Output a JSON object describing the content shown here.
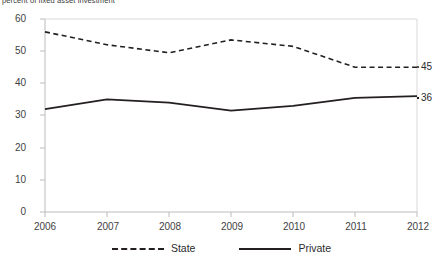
{
  "chart_data": {
    "type": "line",
    "title": "",
    "subtitle": "percent of fixed asset investment",
    "xlabel": "",
    "ylabel": "",
    "categories": [
      "2006",
      "2007",
      "2008",
      "2009",
      "2010",
      "2011",
      "2012"
    ],
    "x": [
      2006,
      2007,
      2008,
      2009,
      2010,
      2011,
      2012
    ],
    "xlim": [
      2006,
      2012
    ],
    "ylim": [
      0,
      60
    ],
    "yticks": [
      0,
      10,
      20,
      30,
      40,
      50,
      60
    ],
    "grid": false,
    "legend_position": "bottom",
    "series": [
      {
        "name": "State",
        "style": "dashed",
        "color": "#231f20",
        "values": [
          56,
          52,
          49.5,
          53.5,
          51.5,
          45,
          45
        ],
        "end_label": "45"
      },
      {
        "name": "Private",
        "style": "solid",
        "color": "#231f20",
        "values": [
          32,
          35,
          34,
          31.5,
          33,
          35.5,
          36
        ],
        "end_label": "36"
      }
    ]
  },
  "axis": {
    "y_tick_labels": [
      "60",
      "50",
      "40",
      "30",
      "20",
      "10",
      "0"
    ],
    "x_tick_labels": [
      "2006",
      "2007",
      "2008",
      "2009",
      "2010",
      "2011",
      "2012"
    ]
  },
  "legend": {
    "items": [
      {
        "label": "State",
        "style": "dashed"
      },
      {
        "label": "Private",
        "style": "solid"
      }
    ]
  },
  "end_labels": {
    "state": "45",
    "private": "36"
  },
  "colors": {
    "line": "#231f20",
    "axis": "#bcbcbc",
    "text": "#3f3f3f"
  }
}
